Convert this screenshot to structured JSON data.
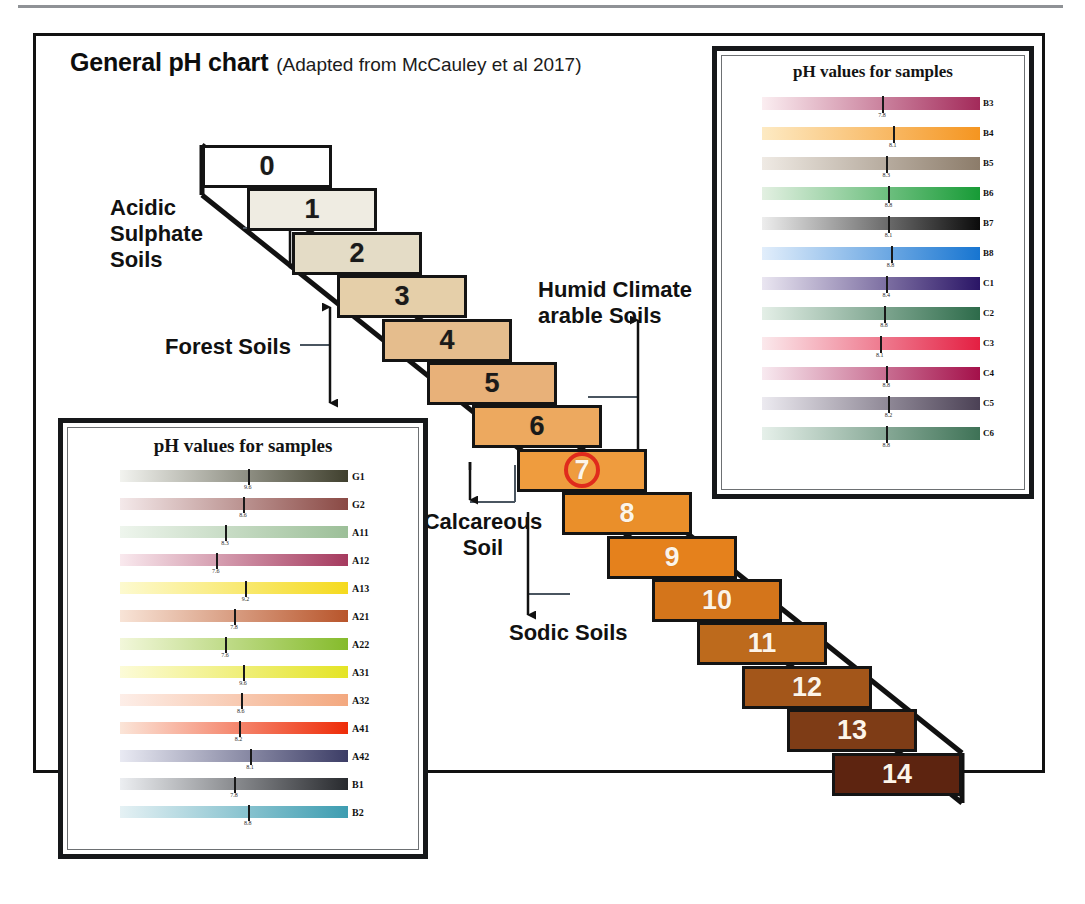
{
  "figure": {
    "title": "General pH chart",
    "subtitle": "(Adapted from McCauley et al 2017)"
  },
  "annotations": {
    "acidic_sulphate_soils": "Acidic\nSulphate\nSoils",
    "forest_soils": "Forest Soils",
    "humid_climate_arable_soils": "Humid Climate\narable Soils",
    "calcareous_soil": "Calcareous\nSoil",
    "sodic_soils": "Sodic Soils"
  },
  "highlight": {
    "circled_ph": "7",
    "circle_color": "#e02b1c"
  },
  "chart_data": {
    "type": "bar",
    "title": "General pH chart",
    "xlabel": "",
    "ylabel": "pH",
    "categories": [
      "0",
      "1",
      "2",
      "3",
      "4",
      "5",
      "6",
      "7",
      "8",
      "9",
      "10",
      "11",
      "12",
      "13",
      "14"
    ],
    "values": [
      0,
      1,
      2,
      3,
      4,
      5,
      6,
      7,
      8,
      9,
      10,
      11,
      12,
      13,
      14
    ],
    "ylim": [
      0,
      14
    ],
    "grid": false,
    "legend": "none",
    "steps": [
      {
        "label": "0",
        "color": "#ffffff",
        "text": "dark"
      },
      {
        "label": "1",
        "color": "#efece2",
        "text": "dark"
      },
      {
        "label": "2",
        "color": "#e4dcc6",
        "text": "dark"
      },
      {
        "label": "3",
        "color": "#e5cfa9",
        "text": "dark"
      },
      {
        "label": "4",
        "color": "#e5bd8d",
        "text": "dark"
      },
      {
        "label": "5",
        "color": "#e8b179",
        "text": "dark"
      },
      {
        "label": "6",
        "color": "#eda95f",
        "text": "dark"
      },
      {
        "label": "7",
        "color": "#ef9c3e",
        "text": "light"
      },
      {
        "label": "8",
        "color": "#ea8f2a",
        "text": "light"
      },
      {
        "label": "9",
        "color": "#e5811c",
        "text": "light"
      },
      {
        "label": "10",
        "color": "#d4751b",
        "text": "light"
      },
      {
        "label": "11",
        "color": "#bd6a1c",
        "text": "light"
      },
      {
        "label": "12",
        "color": "#a3561a",
        "text": "light"
      },
      {
        "label": "13",
        "color": "#7e3c16",
        "text": "light"
      },
      {
        "label": "14",
        "color": "#5d2410",
        "text": "light"
      }
    ],
    "annotated_ranges": [
      {
        "name": "Acidic Sulphate Soils",
        "from": 1,
        "to": 3
      },
      {
        "name": "Forest Soils",
        "from": 3,
        "to": 6
      },
      {
        "name": "Humid Climate arable Soils",
        "from": 5,
        "to": 7
      },
      {
        "name": "Calcareous Soil",
        "from": 7,
        "to": 9
      },
      {
        "name": "Sodic Soils",
        "from": 8,
        "to": 10
      }
    ]
  },
  "panel_top_right": {
    "title": "pH values for samples",
    "rows": [
      {
        "code": "B3",
        "value": "7.8",
        "marker_pct": 55,
        "from": "#fbeef1",
        "to": "#a32a5a"
      },
      {
        "code": "B4",
        "value": "8.1",
        "marker_pct": 60,
        "from": "#fdeac3",
        "to": "#f59520"
      },
      {
        "code": "B5",
        "value": "8.3",
        "marker_pct": 57,
        "from": "#efeae4",
        "to": "#8c7c6a"
      },
      {
        "code": "B6",
        "value": "8.8",
        "marker_pct": 58,
        "from": "#e3f0e2",
        "to": "#179b36"
      },
      {
        "code": "B7",
        "value": "8.1",
        "marker_pct": 58,
        "from": "#ededed",
        "to": "#0b0b0b"
      },
      {
        "code": "B8",
        "value": "8.8",
        "marker_pct": 59,
        "from": "#e2eefb",
        "to": "#1775d1"
      },
      {
        "code": "C1",
        "value": "8.4",
        "marker_pct": 57,
        "from": "#eae6f1",
        "to": "#2a1566"
      },
      {
        "code": "C2",
        "value": "8.8",
        "marker_pct": 56,
        "from": "#e4efe7",
        "to": "#2d6b4a"
      },
      {
        "code": "C3",
        "value": "8.1",
        "marker_pct": 54,
        "from": "#fbe9ec",
        "to": "#e41f42"
      },
      {
        "code": "C4",
        "value": "8.8",
        "marker_pct": 57,
        "from": "#f8eaf0",
        "to": "#a4104a"
      },
      {
        "code": "C5",
        "value": "8.2",
        "marker_pct": 58,
        "from": "#eceaf0",
        "to": "#4b4155"
      },
      {
        "code": "C6",
        "value": "8.8",
        "marker_pct": 57,
        "from": "#e6f0ea",
        "to": "#3e7256"
      }
    ]
  },
  "panel_bottom_left": {
    "title": "pH values for samples",
    "rows": [
      {
        "code": "G1",
        "value": "9.6",
        "marker_pct": 56,
        "from": "#f2f3ef",
        "to": "#40402e"
      },
      {
        "code": "G2",
        "value": "8.6",
        "marker_pct": 54,
        "from": "#f4e9ea",
        "to": "#8a4944"
      },
      {
        "code": "A11",
        "value": "8.3",
        "marker_pct": 46,
        "from": "#eef5ed",
        "to": "#9cbf98"
      },
      {
        "code": "A12",
        "value": "7.6",
        "marker_pct": 42,
        "from": "#f9e9ee",
        "to": "#a53a5e"
      },
      {
        "code": "A13",
        "value": "9.2",
        "marker_pct": 55,
        "from": "#fdfad0",
        "to": "#f5da1e"
      },
      {
        "code": "A21",
        "value": "7.8",
        "marker_pct": 50,
        "from": "#f8e4d7",
        "to": "#b8552b"
      },
      {
        "code": "A22",
        "value": "7.6",
        "marker_pct": 46,
        "from": "#f2f7da",
        "to": "#85bb2b"
      },
      {
        "code": "A31",
        "value": "9.6",
        "marker_pct": 54,
        "from": "#fcfbd8",
        "to": "#e4e425"
      },
      {
        "code": "A32",
        "value": "8.6",
        "marker_pct": 53,
        "from": "#fdeee8",
        "to": "#f3a87f"
      },
      {
        "code": "A41",
        "value": "8.2",
        "marker_pct": 52,
        "from": "#fbe5d8",
        "to": "#ee2c08"
      },
      {
        "code": "A42",
        "value": "8.1",
        "marker_pct": 57,
        "from": "#e9eaf3",
        "to": "#3c3d66"
      },
      {
        "code": "B1",
        "value": "7.8",
        "marker_pct": 50,
        "from": "#eceef1",
        "to": "#282a2e"
      },
      {
        "code": "B2",
        "value": "8.8",
        "marker_pct": 56,
        "from": "#e5f1f4",
        "to": "#3d9db1"
      }
    ]
  }
}
